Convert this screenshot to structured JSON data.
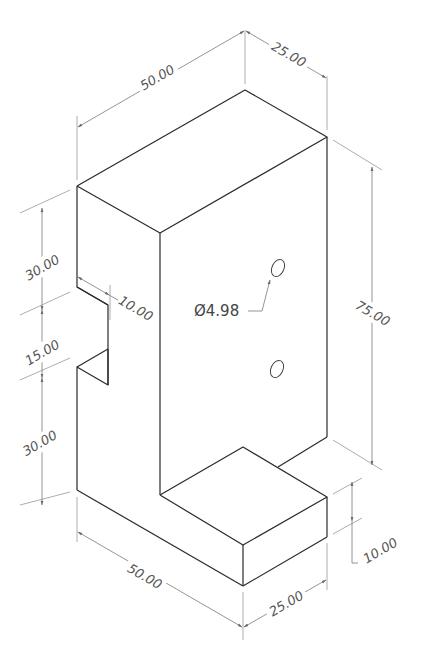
{
  "drawing": {
    "type": "isometric-technical-drawing",
    "units": "mm",
    "dimensions": {
      "top_width": "50.00",
      "top_depth": "25.00",
      "height_total": "75.00",
      "left_upper": "30.00",
      "left_slot": "15.00",
      "left_lower": "30.00",
      "slot_depth": "10.00",
      "hole_diameter": "Ø4.98",
      "base_height": "10.00",
      "bottom_width": "50.00",
      "bottom_depth": "25.00"
    },
    "colors": {
      "edge": "#2a2a2a",
      "dimension": "#7a7a7a",
      "text": "#555555",
      "background": "#ffffff"
    }
  }
}
